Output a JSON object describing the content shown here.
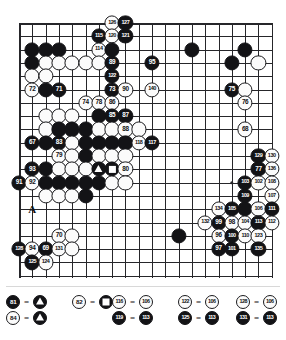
{
  "diagram": {
    "kind": "go-game-record",
    "board": {
      "cols": 20,
      "rows": 20,
      "star_points": [
        [
          16,
          12
        ],
        [
          16,
          3
        ],
        [
          3,
          12
        ]
      ],
      "letter_markers": [
        {
          "label": "A",
          "col": 1,
          "row": 14
        }
      ]
    },
    "stones": [
      {
        "col": 7,
        "row": 0,
        "color": "white",
        "label": "126"
      },
      {
        "col": 8,
        "row": 0,
        "color": "black",
        "label": "127"
      },
      {
        "col": 6,
        "row": 1,
        "color": "black",
        "label": "115"
      },
      {
        "col": 7,
        "row": 1,
        "color": "white",
        "label": "120"
      },
      {
        "col": 8,
        "row": 1,
        "color": "black",
        "label": "121"
      },
      {
        "col": 1,
        "row": 2,
        "color": "black",
        "label": ""
      },
      {
        "col": 2,
        "row": 2,
        "color": "black",
        "label": ""
      },
      {
        "col": 3,
        "row": 2,
        "color": "black",
        "label": ""
      },
      {
        "col": 6,
        "row": 2,
        "color": "white",
        "label": "114"
      },
      {
        "col": 7,
        "row": 2,
        "color": "black",
        "label": ""
      },
      {
        "col": 13,
        "row": 2,
        "color": "black",
        "label": ""
      },
      {
        "col": 17,
        "row": 2,
        "color": "black",
        "label": ""
      },
      {
        "col": 1,
        "row": 3,
        "color": "black",
        "label": ""
      },
      {
        "col": 2,
        "row": 3,
        "color": "white",
        "label": ""
      },
      {
        "col": 3,
        "row": 3,
        "color": "white",
        "label": ""
      },
      {
        "col": 4,
        "row": 3,
        "color": "white",
        "label": ""
      },
      {
        "col": 5,
        "row": 3,
        "color": "white",
        "label": ""
      },
      {
        "col": 6,
        "row": 3,
        "color": "white",
        "label": ""
      },
      {
        "col": 7,
        "row": 3,
        "color": "black",
        "label": "89"
      },
      {
        "col": 10,
        "row": 3,
        "color": "black",
        "label": "95"
      },
      {
        "col": 16,
        "row": 3,
        "color": "black",
        "label": ""
      },
      {
        "col": 18,
        "row": 3,
        "color": "white",
        "label": ""
      },
      {
        "col": 1,
        "row": 4,
        "color": "white",
        "label": ""
      },
      {
        "col": 2,
        "row": 4,
        "color": "white",
        "label": ""
      },
      {
        "col": 7,
        "row": 4,
        "color": "black",
        "label": "122"
      },
      {
        "col": 1,
        "row": 5,
        "color": "white",
        "label": "72"
      },
      {
        "col": 2,
        "row": 5,
        "color": "black",
        "label": ""
      },
      {
        "col": 3,
        "row": 5,
        "color": "black",
        "label": "71"
      },
      {
        "col": 7,
        "row": 5,
        "color": "black",
        "label": "73"
      },
      {
        "col": 8,
        "row": 5,
        "color": "white",
        "label": "90"
      },
      {
        "col": 10,
        "row": 5,
        "color": "white",
        "label": "140"
      },
      {
        "col": 16,
        "row": 5,
        "color": "black",
        "label": "75"
      },
      {
        "col": 17,
        "row": 5,
        "color": "white",
        "label": ""
      },
      {
        "col": 5,
        "row": 6,
        "color": "white",
        "label": "74"
      },
      {
        "col": 6,
        "row": 6,
        "color": "white",
        "label": "78"
      },
      {
        "col": 7,
        "row": 6,
        "color": "white",
        "label": "86"
      },
      {
        "col": 17,
        "row": 6,
        "color": "white",
        "label": "76"
      },
      {
        "col": 2,
        "row": 7,
        "color": "white",
        "label": ""
      },
      {
        "col": 3,
        "row": 7,
        "color": "white",
        "label": ""
      },
      {
        "col": 4,
        "row": 7,
        "color": "white",
        "label": ""
      },
      {
        "col": 6,
        "row": 7,
        "color": "black",
        "label": ""
      },
      {
        "col": 7,
        "row": 7,
        "color": "black",
        "label": "85"
      },
      {
        "col": 8,
        "row": 7,
        "color": "black",
        "label": "87"
      },
      {
        "col": 2,
        "row": 8,
        "color": "white",
        "label": ""
      },
      {
        "col": 3,
        "row": 8,
        "color": "black",
        "label": ""
      },
      {
        "col": 4,
        "row": 8,
        "color": "black",
        "label": ""
      },
      {
        "col": 5,
        "row": 8,
        "color": "black",
        "label": ""
      },
      {
        "col": 6,
        "row": 8,
        "color": "white",
        "label": ""
      },
      {
        "col": 7,
        "row": 8,
        "color": "white",
        "label": ""
      },
      {
        "col": 8,
        "row": 8,
        "color": "white",
        "label": "88"
      },
      {
        "col": 9,
        "row": 8,
        "color": "white",
        "label": ""
      },
      {
        "col": 17,
        "row": 8,
        "color": "white",
        "label": "68"
      },
      {
        "col": 1,
        "row": 9,
        "color": "black",
        "label": "67"
      },
      {
        "col": 2,
        "row": 9,
        "color": "black",
        "label": ""
      },
      {
        "col": 3,
        "row": 9,
        "color": "black",
        "label": "83"
      },
      {
        "col": 4,
        "row": 9,
        "color": "white",
        "label": ""
      },
      {
        "col": 5,
        "row": 9,
        "color": "black",
        "label": ""
      },
      {
        "col": 6,
        "row": 9,
        "color": "black",
        "label": ""
      },
      {
        "col": 7,
        "row": 9,
        "color": "black",
        "label": ""
      },
      {
        "col": 8,
        "row": 9,
        "color": "black",
        "label": ""
      },
      {
        "col": 9,
        "row": 9,
        "color": "white",
        "label": "118"
      },
      {
        "col": 10,
        "row": 9,
        "color": "black",
        "label": "117"
      },
      {
        "col": 3,
        "row": 10,
        "color": "white",
        "label": "79"
      },
      {
        "col": 4,
        "row": 10,
        "color": "white",
        "label": ""
      },
      {
        "col": 5,
        "row": 10,
        "color": "black",
        "label": ""
      },
      {
        "col": 6,
        "row": 10,
        "color": "white",
        "label": ""
      },
      {
        "col": 7,
        "row": 10,
        "color": "white",
        "label": ""
      },
      {
        "col": 8,
        "row": 10,
        "color": "white",
        "label": ""
      },
      {
        "col": 18,
        "row": 10,
        "color": "black",
        "label": "129"
      },
      {
        "col": 19,
        "row": 10,
        "color": "white",
        "label": "130"
      },
      {
        "col": 1,
        "row": 11,
        "color": "black",
        "label": "93"
      },
      {
        "col": 2,
        "row": 11,
        "color": "black",
        "label": ""
      },
      {
        "col": 3,
        "row": 11,
        "color": "white",
        "label": ""
      },
      {
        "col": 4,
        "row": 11,
        "color": "white",
        "label": ""
      },
      {
        "col": 5,
        "row": 11,
        "color": "white",
        "label": ""
      },
      {
        "col": 6,
        "row": 11,
        "color": "black",
        "marker": "triangle"
      },
      {
        "col": 7,
        "row": 11,
        "color": "black",
        "marker": "square"
      },
      {
        "col": 8,
        "row": 11,
        "color": "white",
        "label": "80"
      },
      {
        "col": 18,
        "row": 11,
        "color": "black",
        "label": "77"
      },
      {
        "col": 19,
        "row": 11,
        "color": "white",
        "label": "136"
      },
      {
        "col": 0,
        "row": 12,
        "color": "black",
        "label": "91"
      },
      {
        "col": 1,
        "row": 12,
        "color": "white",
        "label": "92"
      },
      {
        "col": 2,
        "row": 12,
        "color": "black",
        "label": ""
      },
      {
        "col": 3,
        "row": 12,
        "color": "black",
        "label": ""
      },
      {
        "col": 4,
        "row": 12,
        "color": "black",
        "label": ""
      },
      {
        "col": 5,
        "row": 12,
        "color": "black",
        "label": ""
      },
      {
        "col": 6,
        "row": 12,
        "color": "black",
        "label": ""
      },
      {
        "col": 7,
        "row": 12,
        "color": "white",
        "label": ""
      },
      {
        "col": 8,
        "row": 12,
        "color": "white",
        "label": ""
      },
      {
        "col": 17,
        "row": 12,
        "color": "black",
        "label": "103"
      },
      {
        "col": 18,
        "row": 12,
        "color": "white",
        "label": "102"
      },
      {
        "col": 19,
        "row": 12,
        "color": "white",
        "label": "108"
      },
      {
        "col": 2,
        "row": 13,
        "color": "white",
        "label": ""
      },
      {
        "col": 3,
        "row": 13,
        "color": "white",
        "label": ""
      },
      {
        "col": 4,
        "row": 13,
        "color": "white",
        "label": ""
      },
      {
        "col": 5,
        "row": 13,
        "color": "black",
        "label": ""
      },
      {
        "col": 17,
        "row": 13,
        "color": "black",
        "label": "109"
      },
      {
        "col": 19,
        "row": 13,
        "color": "white",
        "label": "107"
      },
      {
        "col": 15,
        "row": 14,
        "color": "white",
        "label": "134"
      },
      {
        "col": 16,
        "row": 14,
        "color": "black",
        "label": "105"
      },
      {
        "col": 17,
        "row": 14,
        "color": "black",
        "label": ""
      },
      {
        "col": 18,
        "row": 14,
        "color": "white",
        "label": "106"
      },
      {
        "col": 19,
        "row": 14,
        "color": "black",
        "label": "111"
      },
      {
        "col": 14,
        "row": 15,
        "color": "white",
        "label": "132"
      },
      {
        "col": 15,
        "row": 15,
        "color": "black",
        "label": "99"
      },
      {
        "col": 16,
        "row": 15,
        "color": "white",
        "label": "98"
      },
      {
        "col": 17,
        "row": 15,
        "color": "white",
        "label": "104"
      },
      {
        "col": 18,
        "row": 15,
        "color": "black",
        "label": "113"
      },
      {
        "col": 19,
        "row": 15,
        "color": "white",
        "label": "112"
      },
      {
        "col": 3,
        "row": 16,
        "color": "white",
        "label": "70"
      },
      {
        "col": 4,
        "row": 16,
        "color": "white",
        "label": ""
      },
      {
        "col": 12,
        "row": 16,
        "color": "black",
        "label": ""
      },
      {
        "col": 15,
        "row": 16,
        "color": "white",
        "label": "96"
      },
      {
        "col": 16,
        "row": 16,
        "color": "black",
        "label": "100"
      },
      {
        "col": 17,
        "row": 16,
        "color": "white",
        "label": "110"
      },
      {
        "col": 18,
        "row": 16,
        "color": "white",
        "label": "123"
      },
      {
        "col": 0,
        "row": 17,
        "color": "black",
        "label": "128"
      },
      {
        "col": 1,
        "row": 17,
        "color": "white",
        "label": "94"
      },
      {
        "col": 2,
        "row": 17,
        "color": "black",
        "label": "69"
      },
      {
        "col": 3,
        "row": 17,
        "color": "white",
        "label": "131"
      },
      {
        "col": 4,
        "row": 17,
        "color": "white",
        "label": ""
      },
      {
        "col": 15,
        "row": 17,
        "color": "black",
        "label": "97"
      },
      {
        "col": 16,
        "row": 17,
        "color": "black",
        "label": "101"
      },
      {
        "col": 18,
        "row": 17,
        "color": "black",
        "label": "135"
      },
      {
        "col": 1,
        "row": 18,
        "color": "black",
        "label": "125"
      },
      {
        "col": 2,
        "row": 18,
        "color": "white",
        "label": "124"
      }
    ],
    "legend": {
      "columns": [
        {
          "rows": [
            {
              "left": {
                "color": "black",
                "label": "81"
              },
              "right": {
                "color": "black",
                "marker": "triangle"
              }
            },
            {
              "left": {
                "color": "white",
                "label": "84"
              },
              "right": {
                "color": "black",
                "marker": "triangle"
              }
            }
          ]
        },
        {
          "rows": [
            {
              "left": {
                "color": "white",
                "label": "82"
              },
              "right": {
                "color": "black",
                "marker": "square"
              }
            }
          ]
        },
        {
          "rows": [
            {
              "left": {
                "color": "white",
                "label": "116"
              },
              "right": {
                "color": "white",
                "label": "106"
              }
            },
            {
              "left": {
                "color": "black",
                "label": "119"
              },
              "right": {
                "color": "black",
                "label": "113"
              }
            }
          ]
        },
        {
          "rows": [
            {
              "left": {
                "color": "white",
                "label": "122"
              },
              "right": {
                "color": "white",
                "label": "106"
              }
            },
            {
              "left": {
                "color": "black",
                "label": "125"
              },
              "right": {
                "color": "black",
                "label": "113"
              }
            }
          ]
        },
        {
          "rows": [
            {
              "left": {
                "color": "white",
                "label": "128"
              },
              "right": {
                "color": "white",
                "label": "106"
              }
            },
            {
              "left": {
                "color": "black",
                "label": "131"
              },
              "right": {
                "color": "black",
                "label": "113"
              }
            }
          ]
        }
      ],
      "equals_symbol": "="
    }
  }
}
